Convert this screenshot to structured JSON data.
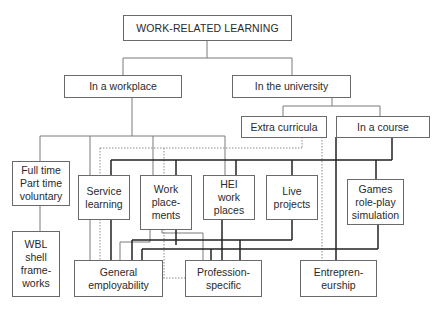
{
  "diagram": {
    "title": "WORK-RELATED LEARNING",
    "nodes": {
      "root": "WORK-RELATED LEARNING",
      "workplace": "In a workplace",
      "university": "In the university",
      "extra_curricula": "Extra curricula",
      "in_a_course": "In a course",
      "full_time": "Full time\nPart time\nvoluntary",
      "service_learning": "Service\nlearning",
      "work_placements": "Work\nplace-\nments",
      "hei_work_places": "HEI\nwork\nplaces",
      "live_projects": "Live\nprojects",
      "games": "Games\nrole-play\nsimulation",
      "wbl": "WBL\nshell\nframe-\nworks",
      "general_employability": "General\nemployability",
      "profession_specific": "Profession-\nspecific",
      "entrepreneurship": "Entrepren-\neurship"
    },
    "line_styles": {
      "thin": "#7a7a7a",
      "thick": "#222222",
      "dotted": "#8a8a8a"
    }
  }
}
